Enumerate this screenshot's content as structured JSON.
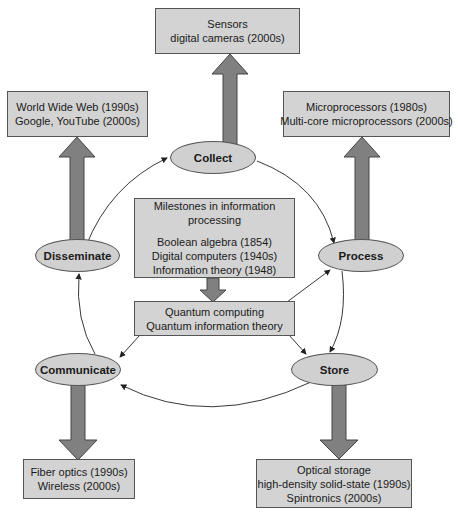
{
  "title": "Milestones in information processing",
  "colors": {
    "box_fill": "#d3d3d3",
    "ellipse_fill": "#d0d0d0",
    "big_arrow": "#808080",
    "outline": "#555555",
    "background": "#ffffff"
  },
  "nodes": {
    "collect": "Collect",
    "process": "Process",
    "store": "Store",
    "communicate": "Communicate",
    "disseminate": "Disseminate"
  },
  "boxes": {
    "sensors": {
      "lines": [
        "Sensors",
        "digital cameras (2000s)"
      ]
    },
    "web": {
      "lines": [
        "World Wide Web (1990s)",
        "Google, YouTube (2000s)"
      ]
    },
    "microprocessors": {
      "lines": [
        "Microprocessors (1980s)",
        "Multi-core microprocessors (2000s)"
      ]
    },
    "milestones": {
      "heading": [
        "Milestones in information",
        "processing"
      ],
      "lines": [
        "Boolean algebra (1854)",
        "Digital computers (1940s)",
        "Information theory (1948)"
      ]
    },
    "quantum": {
      "lines": [
        "Quantum computing",
        "Quantum information theory"
      ]
    },
    "fiber": {
      "lines": [
        "Fiber optics (1990s)",
        "Wireless (2000s)"
      ]
    },
    "storage": {
      "lines": [
        "Optical storage",
        "high-density solid-state (1990s)",
        "Spintronics (2000s)"
      ]
    }
  },
  "cycle": [
    "Collect",
    "Process",
    "Store",
    "Communicate",
    "Disseminate"
  ],
  "icons": [
    "big-arrow-up",
    "big-arrow-down",
    "thin-arrow"
  ]
}
